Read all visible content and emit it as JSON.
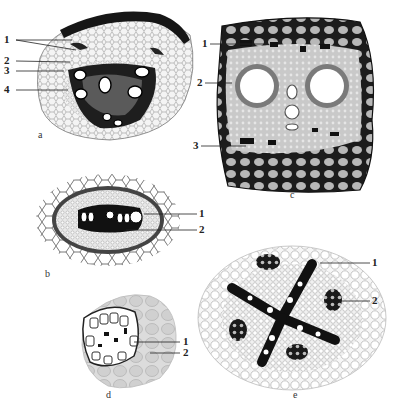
{
  "figure": {
    "panels": [
      {
        "id": "a",
        "label": "a",
        "callouts": [
          "1",
          "2",
          "3",
          "4"
        ]
      },
      {
        "id": "b",
        "label": "b",
        "callouts": [
          "1",
          "2"
        ]
      },
      {
        "id": "c",
        "label": "c",
        "callouts": [
          "1",
          "2",
          "3"
        ]
      },
      {
        "id": "d",
        "label": "d",
        "callouts": [
          "1",
          "2"
        ]
      },
      {
        "id": "e",
        "label": "e",
        "callouts": [
          "1",
          "2"
        ]
      }
    ]
  }
}
